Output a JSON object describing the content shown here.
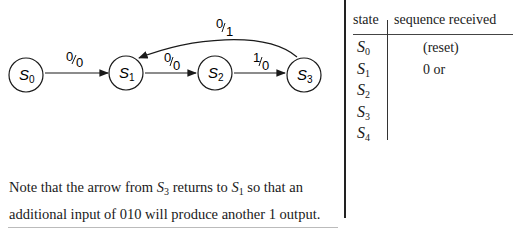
{
  "diagram": {
    "states": [
      {
        "id": "S0",
        "label": "S",
        "sub": "0",
        "cx": 26,
        "cy": 75
      },
      {
        "id": "S1",
        "label": "S",
        "sub": "1",
        "cx": 126,
        "cy": 73
      },
      {
        "id": "S2",
        "label": "S",
        "sub": "2",
        "cx": 215,
        "cy": 73
      },
      {
        "id": "S3",
        "label": "S",
        "sub": "3",
        "cx": 304,
        "cy": 75
      }
    ],
    "edges": [
      {
        "from": "S0",
        "to": "S1",
        "input": "0",
        "output": "0",
        "label": "0/0"
      },
      {
        "from": "S1",
        "to": "S2",
        "input": "0",
        "output": "0",
        "label": "0/0"
      },
      {
        "from": "S2",
        "to": "S3",
        "input": "1",
        "output": "0",
        "label": "1/0"
      },
      {
        "from": "S3",
        "to": "S1",
        "input": "0",
        "output": "1",
        "label": "0/1"
      }
    ],
    "edge_labels": {
      "s0_s1": {
        "num": "0",
        "den": "0"
      },
      "s1_s2": {
        "num": "0",
        "den": "0"
      },
      "s2_s3": {
        "num": "1",
        "den": "0"
      },
      "s3_s1": {
        "num": "0",
        "den": "1"
      }
    }
  },
  "table": {
    "headers": {
      "state": "state",
      "sequence": "sequence received"
    },
    "rows": [
      {
        "state": "S",
        "sub": "0",
        "sequence": "(reset)"
      },
      {
        "state": "S",
        "sub": "1",
        "sequence": "0 or"
      },
      {
        "state": "S",
        "sub": "2",
        "sequence": ""
      },
      {
        "state": "S",
        "sub": "3",
        "sequence": ""
      },
      {
        "state": "S",
        "sub": "4",
        "sequence": ""
      }
    ]
  },
  "note": {
    "line1_a": "Note that the arrow from ",
    "s3": "S",
    "s3_sub": "3",
    "line1_b": " returns to ",
    "s1": "S",
    "s1_sub": "1",
    "line1_c": " so that an",
    "line2": "additional input of 010 will produce another 1 output."
  }
}
